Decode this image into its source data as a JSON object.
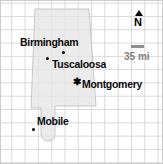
{
  "map": {
    "cities": [
      {
        "name": "Birmingham",
        "marker": "dot"
      },
      {
        "name": "Tuscaloosa",
        "marker": "dot"
      },
      {
        "name": "Montgomery",
        "marker": "capital-star"
      },
      {
        "name": "Mobile",
        "marker": "dot"
      }
    ],
    "compass": {
      "label": "N"
    },
    "scale_bar": {
      "label": "35 mi",
      "length_miles": 35
    },
    "markers": {
      "capital_glyph": "✱"
    },
    "colors": {
      "state_fill": "#e5e5e5",
      "state_stroke": "#c6c6c6",
      "grid_line": "#d8d8d8",
      "label_text": "#0a0a0a",
      "marker": "#000000",
      "scale_bar": "#8f8f8f",
      "scale_text": "#7d7d7d"
    }
  }
}
